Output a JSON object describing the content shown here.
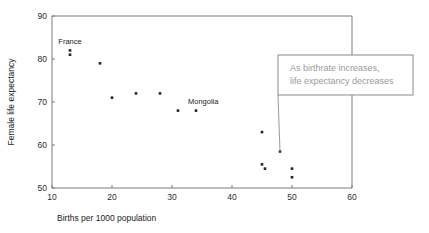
{
  "chart_data": {
    "type": "scatter",
    "title": "",
    "xlabel": "Births per 1000 population",
    "ylabel": "Female life expectancy",
    "xlim": [
      10,
      60
    ],
    "ylim": [
      50,
      90
    ],
    "xticks": [
      10,
      20,
      30,
      40,
      50,
      60
    ],
    "yticks": [
      50,
      60,
      70,
      80,
      90
    ],
    "xtick_labels": [
      "10",
      "20",
      "30",
      "40",
      "50",
      "60"
    ],
    "ytick_labels": [
      "50",
      "60",
      "70",
      "80",
      "90"
    ],
    "grid": false,
    "legend": false,
    "points": [
      {
        "x": 13,
        "y": 82,
        "label": ""
      },
      {
        "x": 13,
        "y": 81,
        "label": "France"
      },
      {
        "x": 18,
        "y": 79,
        "label": ""
      },
      {
        "x": 20,
        "y": 71,
        "label": ""
      },
      {
        "x": 24,
        "y": 72,
        "label": ""
      },
      {
        "x": 28,
        "y": 72,
        "label": ""
      },
      {
        "x": 31,
        "y": 68,
        "label": ""
      },
      {
        "x": 34,
        "y": 68,
        "label": "Mongolia"
      },
      {
        "x": 45,
        "y": 63,
        "label": ""
      },
      {
        "x": 48,
        "y": 58.5,
        "label": ""
      },
      {
        "x": 45,
        "y": 55.5,
        "label": ""
      },
      {
        "x": 45.5,
        "y": 54.5,
        "label": ""
      },
      {
        "x": 50,
        "y": 54.5,
        "label": ""
      },
      {
        "x": 50,
        "y": 52.5,
        "label": ""
      }
    ],
    "annotations": [
      {
        "name": "trend-callout",
        "line1": "As birthrate increases,",
        "line2": "life expectancy decreases",
        "points_to": {
          "x": 48,
          "y": 58.5
        }
      }
    ],
    "point_labels": [
      {
        "text": "France",
        "x": 13,
        "y": 83.6
      },
      {
        "text": "Mongolia",
        "x": 35.2,
        "y": 69.6
      }
    ],
    "colors": {
      "point": "#23232e",
      "axis": "#7d7d7d",
      "annotation_text": "#9a9a9a",
      "annotation_border": "#8a8a8a",
      "background": "#ffffff"
    }
  }
}
